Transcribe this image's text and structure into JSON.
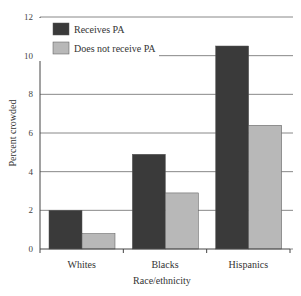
{
  "chart_data": {
    "type": "bar",
    "title": "",
    "xlabel": "Race/ethnicity",
    "ylabel": "Percent crowded",
    "categories": [
      "Whites",
      "Blacks",
      "Hispanics"
    ],
    "series": [
      {
        "name": "Receives PA",
        "color": "#3a3a3a",
        "values": [
          2.0,
          4.9,
          10.5
        ]
      },
      {
        "name": "Does not receive PA",
        "color": "#b8b8b8",
        "values": [
          0.8,
          2.9,
          6.4
        ]
      }
    ],
    "ylim": [
      0,
      12
    ],
    "yticks": [
      0,
      2,
      4,
      6,
      8,
      10,
      12
    ],
    "grid": true,
    "legend_position": "upper left"
  }
}
